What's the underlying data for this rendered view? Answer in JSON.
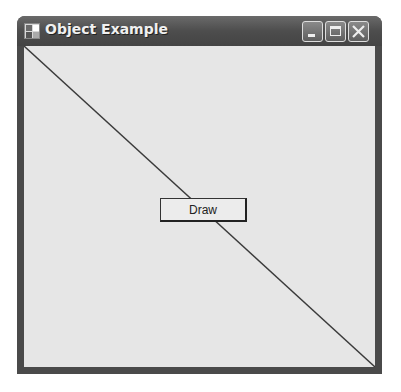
{
  "window": {
    "title": "Object Example",
    "icon": "app-window-icon",
    "caption_buttons": [
      "minimize",
      "maximize",
      "close"
    ]
  },
  "client": {
    "background": "#e6e6e6",
    "line": {
      "from": "top-left",
      "to": "bottom-right",
      "color": "#3a3a3a"
    },
    "draw_button": {
      "label": "Draw"
    }
  }
}
